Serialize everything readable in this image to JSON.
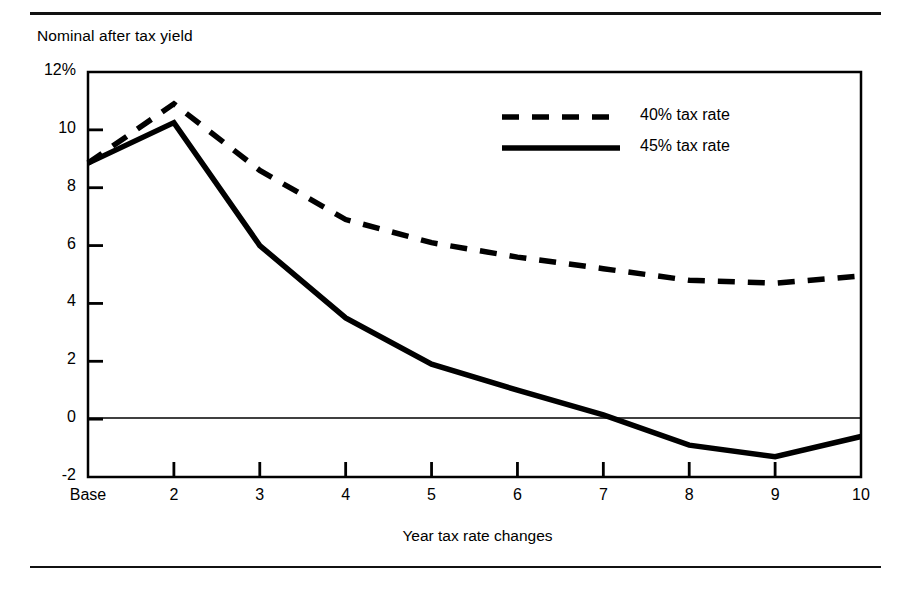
{
  "chart_data": {
    "type": "line",
    "title": "",
    "ylabel": "Nominal after tax yield",
    "xlabel": "Year tax rate changes",
    "categories": [
      "Base",
      "2",
      "3",
      "4",
      "5",
      "6",
      "7",
      "8",
      "9",
      "10"
    ],
    "x": [
      1,
      2,
      3,
      4,
      5,
      6,
      7,
      8,
      9,
      10
    ],
    "xlim": [
      1,
      10
    ],
    "ylim": [
      -2,
      12
    ],
    "yticks": [
      12,
      10,
      8,
      6,
      4,
      2,
      0,
      -2
    ],
    "ytick_labels": [
      "12%",
      "10",
      "8",
      "6",
      "4",
      "2",
      "0",
      "-2"
    ],
    "grid": false,
    "zero_line": true,
    "legend_position": "upper-right-inside",
    "series": [
      {
        "name": "40% tax rate",
        "style": "dashed",
        "color": "#000000",
        "values": [
          8.85,
          10.9,
          8.6,
          6.9,
          6.1,
          5.6,
          5.2,
          4.8,
          4.7,
          4.95
        ]
      },
      {
        "name": "45% tax rate",
        "style": "solid",
        "color": "#000000",
        "values": [
          8.85,
          10.25,
          6.0,
          3.5,
          1.9,
          1.0,
          0.15,
          -0.9,
          -1.3,
          -0.6
        ]
      }
    ]
  },
  "legend": {
    "items": [
      {
        "label": "40% tax rate",
        "style": "dashed"
      },
      {
        "label": "45% tax rate",
        "style": "solid"
      }
    ]
  }
}
